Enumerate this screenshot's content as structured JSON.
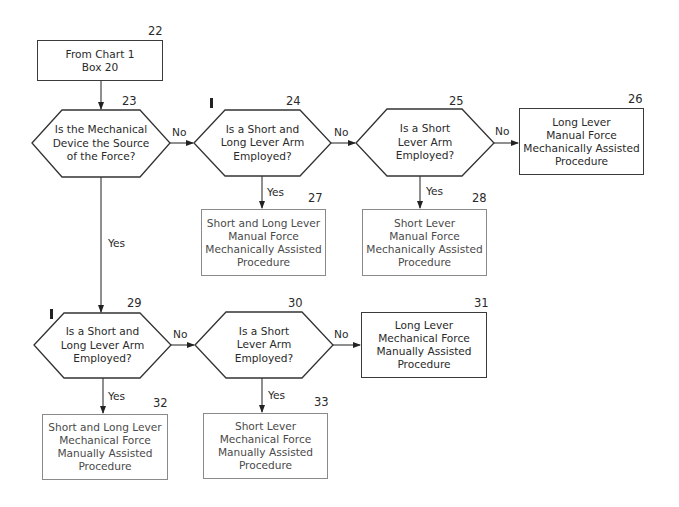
{
  "nodes": {
    "n22": {
      "id": "22",
      "type": "box",
      "lines": [
        "From Chart 1",
        "Box 20"
      ]
    },
    "n23": {
      "id": "23",
      "type": "decision",
      "lines": [
        "Is the Mechanical",
        "Device the Source",
        "of the Force?"
      ]
    },
    "n24": {
      "id": "24",
      "type": "decision",
      "lines": [
        "Is a Short and",
        "Long Lever Arm",
        "Employed?"
      ]
    },
    "n25": {
      "id": "25",
      "type": "decision",
      "lines": [
        "Is a Short",
        "Lever Arm",
        "Employed?"
      ]
    },
    "n26": {
      "id": "26",
      "type": "box",
      "lines": [
        "Long Lever",
        "Manual Force",
        "Mechanically Assisted",
        "Procedure"
      ]
    },
    "n27": {
      "id": "27",
      "type": "box",
      "lines": [
        "Short and Long Lever",
        "Manual Force",
        "Mechanically Assisted",
        "Procedure"
      ]
    },
    "n28": {
      "id": "28",
      "type": "box",
      "lines": [
        "Short Lever",
        "Manual Force",
        "Mechanically Assisted",
        "Procedure"
      ]
    },
    "n29": {
      "id": "29",
      "type": "decision",
      "lines": [
        "Is a Short and",
        "Long Lever Arm",
        "Employed?"
      ]
    },
    "n30": {
      "id": "30",
      "type": "decision",
      "lines": [
        "Is a Short",
        "Lever Arm",
        "Employed?"
      ]
    },
    "n31": {
      "id": "31",
      "type": "box",
      "lines": [
        "Long Lever",
        "Mechanical Force",
        "Manually Assisted",
        "Procedure"
      ]
    },
    "n32": {
      "id": "32",
      "type": "box",
      "lines": [
        "Short and Long Lever",
        "Mechanical Force",
        "Manually Assisted",
        "Procedure"
      ]
    },
    "n33": {
      "id": "33",
      "type": "box",
      "lines": [
        "Short Lever",
        "Mechanical Force",
        "Manually Assisted",
        "Procedure"
      ]
    }
  },
  "edges": [
    {
      "from": "22",
      "to": "23",
      "label": ""
    },
    {
      "from": "23",
      "to": "24",
      "label": "No"
    },
    {
      "from": "24",
      "to": "25",
      "label": "No"
    },
    {
      "from": "25",
      "to": "26",
      "label": "No"
    },
    {
      "from": "24",
      "to": "27",
      "label": "Yes"
    },
    {
      "from": "25",
      "to": "28",
      "label": "Yes"
    },
    {
      "from": "23",
      "to": "29",
      "label": "Yes"
    },
    {
      "from": "29",
      "to": "30",
      "label": "No"
    },
    {
      "from": "30",
      "to": "31",
      "label": "No"
    },
    {
      "from": "29",
      "to": "32",
      "label": "Yes"
    },
    {
      "from": "30",
      "to": "33",
      "label": "Yes"
    }
  ],
  "labels": {
    "no": "No",
    "yes": "Yes"
  }
}
